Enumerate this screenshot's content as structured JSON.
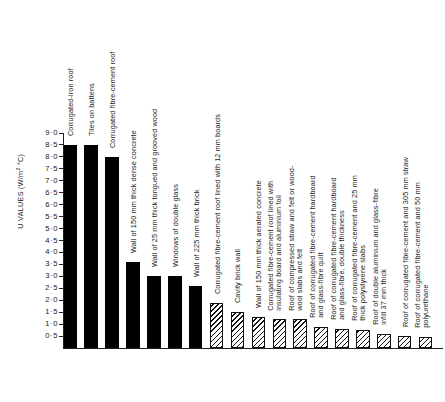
{
  "chart_data": {
    "type": "bar",
    "title": "",
    "xlabel": "",
    "ylabel": "U VALUES (W/m² °C)",
    "ylim": [
      0,
      9.0
    ],
    "ytick_values": [
      9.0,
      8.5,
      8.0,
      7.5,
      7.0,
      6.5,
      6.0,
      5.5,
      5.0,
      4.5,
      4.0,
      3.5,
      3.0,
      2.5,
      2.0,
      1.5,
      1.0,
      0.5
    ],
    "ytick_labels": [
      "9·0",
      "8·5",
      "8·0",
      "7·5",
      "7·0",
      "6·5",
      "6·0",
      "5·5",
      "5·0",
      "4·5",
      "4·0",
      "3·5",
      "3·0",
      "2·5",
      "2·0",
      "1·5",
      "1·0",
      "0·5"
    ],
    "grid": false,
    "legend": false,
    "categories": [
      "Corrugated-iron roof",
      "Tiles on battens",
      "Corrugated fibre-cement roof",
      "Wall of 150 mm thick dense concrete",
      "Wall of 25 mm thick tongued and grooved wood",
      "Windows of double glass",
      "Wall of 225 mm thick brick",
      "Corrugated fibre-cement roof lined with 12 mm boards",
      "Cavity brick wall",
      "Wall of 150 mm thick aerated concrete",
      "Corrugated fibre-cement roof lined with insulating board and aluminium foil",
      "Roof of compressed straw and felt or wood-wool slabs and felt",
      "Roof of corrugated fibre-cement hardboard and glass-fibre quilt",
      "Roof of corrugated fibre-cement hardboard and glass-fibre, double thickness",
      "Roof of corrugated fibre-cement and 25 mm thick polystyrene slabs",
      "Roof of double aluminium and glass-fibre infill 37 mm thick",
      "Roof of corrugated fibre-cement and 305 mm straw",
      "Roof of corrugated fibre-cement and 50 mm polyurethane"
    ],
    "values": [
      8.5,
      8.5,
      8.0,
      3.6,
      3.0,
      3.0,
      2.6,
      1.9,
      1.5,
      1.3,
      1.2,
      1.2,
      0.9,
      0.8,
      0.75,
      0.6,
      0.5,
      0.45
    ],
    "fills": [
      "solid",
      "solid",
      "solid",
      "solid",
      "solid",
      "solid",
      "solid",
      "hatch",
      "hatch",
      "hatch",
      "hatch",
      "hatch",
      "hatch",
      "hatch",
      "hatch",
      "hatch",
      "hatch",
      "hatch"
    ],
    "colors": {
      "solid_bar": "#000000",
      "hatch_line": "#111111",
      "hatch_background": "#ffffff",
      "axis": "#222222",
      "text": "#1a1a1a"
    }
  }
}
